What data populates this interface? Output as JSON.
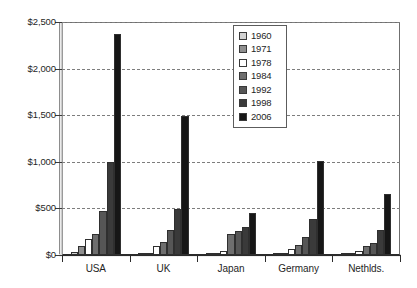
{
  "chart_data": {
    "type": "bar",
    "title": "",
    "subtitle": "",
    "xlabel": "",
    "ylabel": "",
    "ylim": [
      0,
      2500
    ],
    "ytick_values": [
      0,
      500,
      1000,
      1500,
      2000,
      2500
    ],
    "ytick_labels": [
      "$0",
      "$500",
      "$1,000",
      "$1,500",
      "$2,000",
      "$2,500"
    ],
    "grid": "horizontal-dashed",
    "legend_position": "top-center-right",
    "categories": [
      "USA",
      "UK",
      "Japan",
      "Germany",
      "Nethlds."
    ],
    "series": [
      {
        "name": "1960",
        "color": "#d2d2d2",
        "values": [
          30,
          10,
          8,
          8,
          8
        ]
      },
      {
        "name": "1971",
        "color": "#8f8f8f",
        "values": [
          95,
          25,
          20,
          18,
          18
        ]
      },
      {
        "name": "1978",
        "color": "#ffffff",
        "values": [
          170,
          95,
          45,
          60,
          45
        ]
      },
      {
        "name": "1984",
        "color": "#6e6e6e",
        "values": [
          230,
          140,
          230,
          105,
          95
        ]
      },
      {
        "name": "1992",
        "color": "#565656",
        "values": [
          470,
          265,
          255,
          190,
          130
        ]
      },
      {
        "name": "1998",
        "color": "#3a3a3a",
        "values": [
          1000,
          495,
          300,
          385,
          265
        ]
      },
      {
        "name": "2006",
        "color": "#161616",
        "values": [
          2375,
          1490,
          450,
          1010,
          650
        ]
      }
    ]
  },
  "legend": {
    "entries": [
      "1960",
      "1971",
      "1978",
      "1984",
      "1992",
      "1998",
      "2006"
    ]
  },
  "axes": {
    "y_labels": [
      "$2,500",
      "$2,000",
      "$1,500",
      "$1,000",
      "$500",
      "$0"
    ],
    "x_labels": [
      "USA",
      "UK",
      "Japan",
      "Germany",
      "Nethlds."
    ]
  },
  "colors": {
    "background": "#ffffff",
    "axis": "#2b2b2b",
    "grid": "#7d7d7d",
    "text": "#1f1f1f"
  }
}
